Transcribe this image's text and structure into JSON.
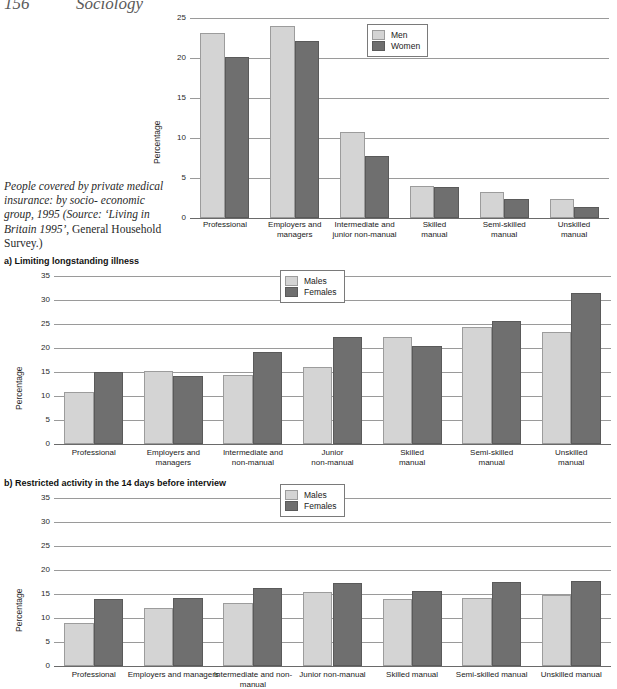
{
  "page": {
    "folio": "156",
    "book_title": "Sociology"
  },
  "caption": {
    "line1": "People covered by private",
    "line2": "medical insurance: by socio-",
    "line3": "economic group, 1995",
    "source_open": "(Source: ",
    "source_title": "‘Living in Britain",
    "source_year": "1995’",
    "source_rest": ", General Household",
    "source_end": "Survey.)"
  },
  "sections": {
    "a_label": "a)  Limiting longstanding illness",
    "b_label": "b)  Restricted activity in the 14 days before interview"
  },
  "colors": {
    "series_light": "#d4d4d4",
    "series_dark": "#6f6f6f",
    "gridline": "#9a9a9a",
    "axis": "#6a6a6a"
  },
  "chart_data": [
    {
      "id": "private-medical-insurance",
      "type": "bar",
      "title": "",
      "xlabel": "",
      "ylabel": "Percentage",
      "ylim": [
        0,
        25
      ],
      "yticks": [
        0,
        5,
        10,
        15,
        20,
        25
      ],
      "ytick_labels": [
        "0",
        "5",
        "10",
        "15",
        "20",
        "25"
      ],
      "grid": true,
      "legend_position": "top-center",
      "categories": [
        "Professional",
        "Employers and managers",
        "Intermediate and junior non-manual",
        "Skilled manual",
        "Semi-skilled manual",
        "Unskilled manual"
      ],
      "category_lines": [
        [
          "Professional"
        ],
        [
          "Employers and",
          "managers"
        ],
        [
          "Intermediate and",
          "junior non-manual"
        ],
        [
          "Skilled",
          "manual"
        ],
        [
          "Semi-skilled",
          "manual"
        ],
        [
          "Unskilled",
          "manual"
        ]
      ],
      "series": [
        {
          "name": "Men",
          "values": [
            23.1,
            24.0,
            10.8,
            4.0,
            3.2,
            2.4
          ]
        },
        {
          "name": "Women",
          "values": [
            20.1,
            22.1,
            7.8,
            3.9,
            2.4,
            1.4
          ]
        }
      ]
    },
    {
      "id": "limiting-longstanding-illness",
      "type": "bar",
      "title": "a)  Limiting longstanding illness",
      "xlabel": "",
      "ylabel": "Percentage",
      "ylim": [
        0,
        35
      ],
      "yticks": [
        0,
        5,
        10,
        15,
        20,
        25,
        30,
        35
      ],
      "ytick_labels": [
        "0",
        "5",
        "10",
        "15",
        "20",
        "25",
        "30",
        "35"
      ],
      "grid": true,
      "legend_position": "top-center",
      "categories": [
        "Professional",
        "Employers and managers",
        "Intermediate and non-manual",
        "Junior non-manual",
        "Skilled manual",
        "Semi-skilled manual",
        "Unskilled manual"
      ],
      "category_lines": [
        [
          "Professional"
        ],
        [
          "Employers and",
          "managers"
        ],
        [
          "Intermediate and",
          "non-manual"
        ],
        [
          "Junior",
          "non-manual"
        ],
        [
          "Skilled",
          "manual"
        ],
        [
          "Semi-skilled",
          "manual"
        ],
        [
          "Unskilled",
          "manual"
        ]
      ],
      "series": [
        {
          "name": "Males",
          "values": [
            10.8,
            15.2,
            14.3,
            16.1,
            22.3,
            24.3,
            23.4
          ]
        },
        {
          "name": "Females",
          "values": [
            15.1,
            14.1,
            19.2,
            22.3,
            20.5,
            25.7,
            31.4
          ]
        }
      ]
    },
    {
      "id": "restricted-activity-14-days",
      "type": "bar",
      "title": "b)  Restricted activity in the 14 days before interview",
      "xlabel": "",
      "ylabel": "Percentage",
      "ylim": [
        0,
        35
      ],
      "yticks": [
        0,
        5,
        10,
        15,
        20,
        25,
        30,
        35
      ],
      "ytick_labels": [
        "0",
        "5",
        "10",
        "15",
        "20",
        "25",
        "30",
        "35"
      ],
      "grid": true,
      "legend_position": "top-center",
      "categories": [
        "Professional",
        "Employers and managers",
        "Intermediate and non-manual",
        "Junior non-manual",
        "Skilled manual",
        "Semi-skilled manual",
        "Unskilled manual"
      ],
      "series": [
        {
          "name": "Males",
          "values": [
            9.0,
            12.0,
            13.2,
            15.4,
            14.0,
            14.1,
            14.7
          ]
        },
        {
          "name": "Females",
          "values": [
            13.9,
            14.1,
            16.3,
            17.3,
            15.6,
            17.5,
            17.8
          ]
        }
      ]
    }
  ]
}
